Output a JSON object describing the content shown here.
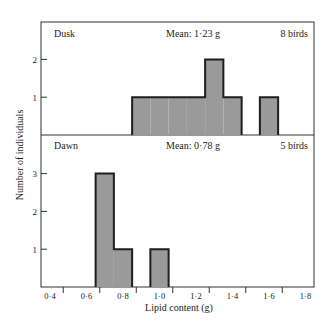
{
  "chart_data": {
    "type": "bar",
    "subtype": "histogram",
    "xlabel": "Lipid content (g)",
    "ylabel": "Number of individuals",
    "x_ticks": [
      "0·4",
      "0·6",
      "0·8",
      "1·0",
      "1·2",
      "1·4",
      "1·6",
      "1·8"
    ],
    "xlim": [
      0.35,
      1.85
    ],
    "bin_width": 0.1,
    "panels": [
      {
        "name": "Dusk",
        "mean_label": "Mean: 1·23 g",
        "count_label": "8 birds",
        "y_ticks": [
          "1",
          "2"
        ],
        "ylim": [
          0,
          2.9
        ],
        "bins": [
          {
            "start": 0.85,
            "end": 0.95,
            "count": 1
          },
          {
            "start": 0.95,
            "end": 1.05,
            "count": 1
          },
          {
            "start": 1.05,
            "end": 1.15,
            "count": 1
          },
          {
            "start": 1.15,
            "end": 1.25,
            "count": 1
          },
          {
            "start": 1.25,
            "end": 1.35,
            "count": 2
          },
          {
            "start": 1.35,
            "end": 1.45,
            "count": 1
          },
          {
            "start": 1.55,
            "end": 1.65,
            "count": 1
          }
        ]
      },
      {
        "name": "Dawn",
        "mean_label": "Mean: 0·78 g",
        "count_label": "5 birds",
        "y_ticks": [
          "1",
          "2",
          "3"
        ],
        "ylim": [
          0,
          4.0
        ],
        "bins": [
          {
            "start": 0.65,
            "end": 0.75,
            "count": 3
          },
          {
            "start": 0.75,
            "end": 0.85,
            "count": 1
          },
          {
            "start": 0.95,
            "end": 1.05,
            "count": 1
          }
        ]
      }
    ],
    "colors": {
      "bar_fill": "#9a9a9a",
      "bar_edge": "#1e1e1e",
      "axis": "#333333"
    },
    "grid": false,
    "legend": null
  }
}
